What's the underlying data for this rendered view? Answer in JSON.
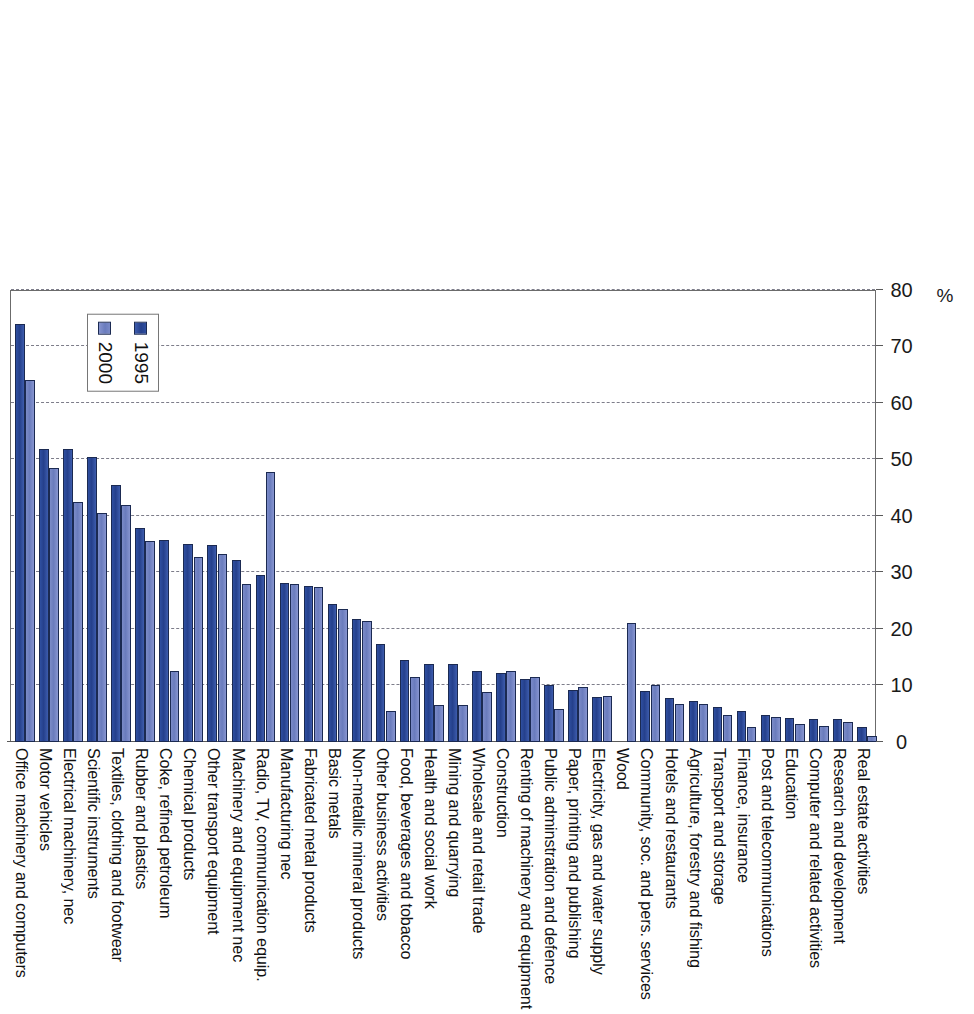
{
  "chart_data": {
    "type": "bar",
    "title": "",
    "subtitle": "",
    "xlabel": "",
    "ylabel": "%",
    "axis_unit": "%",
    "orientation": "rotated-vertical-bars",
    "grid": true,
    "legend_position": "upper-left-inside",
    "ylim": [
      0,
      80
    ],
    "ytick_labels": [
      "0",
      "10",
      "20",
      "30",
      "40",
      "50",
      "60",
      "70",
      "80"
    ],
    "ytick_values": [
      0,
      10,
      20,
      30,
      40,
      50,
      60,
      70,
      80
    ],
    "categories": [
      "Office machinery and computers",
      "Motor vehicles",
      "Electrical machinery, nec",
      "Scientific instruments",
      "Textiles, clothing and footwear",
      "Rubber and plastics",
      "Coke, refined petroleum",
      "Chemical products",
      "Other transport equipment",
      "Machinery and equipment nec",
      "Radio, TV, communication equip.",
      "Manufacturing nec",
      "Fabricated metal products",
      "Basic metals",
      "Non-metallic mineral products",
      "Other business activities",
      "Food, beverages and tobacco",
      "Health and social work",
      "Mining and quarrying",
      "Wholesale and retail trade",
      "Construction",
      "Renting of machinery and equipment",
      "Public adminstration and defence",
      "Paper, printing and publishing",
      "Electricity, gas and water supply",
      "Wood",
      "Community, soc. and pers. services",
      "Hotels and restaurants",
      "Agriculture, forestry and fishing",
      "Transport and storage",
      "Finance, insurance",
      "Post and telecommunications",
      "Education",
      "Computer and related activities",
      "Research and development",
      "Real estate activities"
    ],
    "series": [
      {
        "name": "1995",
        "color": "#25408c",
        "values": [
          74.0,
          51.8,
          51.8,
          50.5,
          45.5,
          37.8,
          35.8,
          35.0,
          34.8,
          32.2,
          29.5,
          28.2,
          27.6,
          24.5,
          21.8,
          17.3,
          14.5,
          13.8,
          13.8,
          12.6,
          12.2,
          11.2,
          10.0,
          9.2,
          8.0,
          0.0,
          9.0,
          7.8,
          7.2,
          6.2,
          5.5,
          4.8,
          4.2,
          4.0,
          4.0,
          2.6
        ]
      },
      {
        "name": "2000",
        "color": "#6a7cbd",
        "values": [
          64.0,
          48.5,
          42.5,
          40.5,
          42.0,
          35.5,
          12.5,
          32.8,
          33.2,
          28.0,
          47.8,
          28.0,
          27.4,
          23.5,
          21.5,
          5.5,
          11.5,
          6.5,
          6.5,
          8.8,
          12.5,
          11.5,
          5.8,
          9.8,
          8.2,
          21.0,
          10.0,
          6.8,
          6.8,
          4.8,
          2.6,
          4.5,
          3.2,
          2.8,
          3.5,
          1.0
        ]
      }
    ],
    "legend": [
      {
        "label": "1995",
        "color": "#25408c"
      },
      {
        "label": "2000",
        "color": "#6a7cbd"
      }
    ]
  }
}
